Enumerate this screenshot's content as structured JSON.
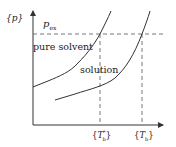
{
  "diagram": {
    "type": "phase-diagram",
    "y_axis_label": "{p}",
    "x_axis_label": "",
    "pressure_line_label": "p",
    "pressure_line_subscript": "ex",
    "curves": [
      {
        "name": "pure solvent",
        "label": "pure solvent"
      },
      {
        "name": "solution",
        "label": "solution"
      }
    ],
    "x_ticks": [
      {
        "label_main": "T",
        "label_sub": "b",
        "label_sup": "*",
        "note": "{T*b}"
      },
      {
        "label_main": "T",
        "label_sub": "b",
        "label_sup": "",
        "note": "{Tb}"
      }
    ],
    "colors": {
      "line": "#333333",
      "background": "#ffffff"
    }
  }
}
